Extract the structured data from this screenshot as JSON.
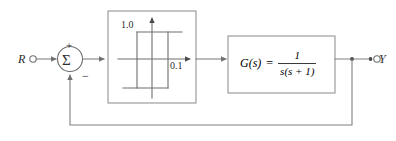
{
  "figure": {
    "kind": "control-system-block-diagram",
    "line_color": "#808080",
    "text_color": "#2b2b2b",
    "background": "#ffffff"
  },
  "signals": {
    "input_label": "R",
    "output_label": "Y"
  },
  "summing_junction": {
    "symbol": "Σ",
    "plus_sign": "+",
    "minus_sign": "−"
  },
  "nonlinearity_block": {
    "type": "relay-with-hysteresis",
    "upper_level_label": "1.0",
    "lower_level_label": "0.1"
  },
  "plant_block": {
    "lhs": "G(s)",
    "equals": "=",
    "numerator": "1",
    "denominator": "s(s + 1)"
  }
}
